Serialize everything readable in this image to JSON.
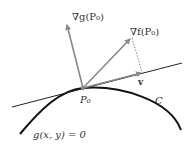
{
  "diagram": {
    "labels": {
      "grad_g": "∇g(P₀)",
      "grad_f": "∇f(P₀)",
      "v": "v",
      "point": "P₀",
      "curve_name": "C",
      "constraint": "g(x, y) = 0"
    },
    "colors": {
      "curve": "#111111",
      "tangent_line": "#222222",
      "vectors": "#888888",
      "dotted": "#888888",
      "text": "#333333"
    }
  }
}
